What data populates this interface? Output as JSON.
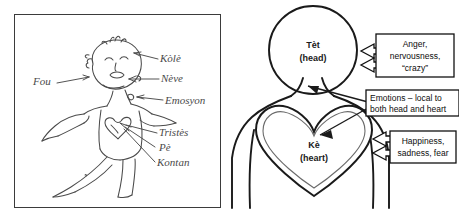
{
  "figure": {
    "panels": [
      "sketch-panel",
      "diagram-panel"
    ]
  },
  "left_panel": {
    "name": "hand-drawn-sketch",
    "description": "Hand drawn sketch of a person with arms outstretched, a heart on the chest, and handwritten Haitian Creole labels with arrows",
    "labels": [
      {
        "text": "Fou",
        "target": "head",
        "position": "left"
      },
      {
        "text": "Kòlè",
        "target": "head",
        "position": "upper-right"
      },
      {
        "text": "Nève",
        "target": "head",
        "position": "right"
      },
      {
        "text": "Emosyon",
        "target": "neck",
        "position": "right"
      },
      {
        "text": "Tristès",
        "target": "heart",
        "position": "lower-right"
      },
      {
        "text": "Pè",
        "target": "heart",
        "position": "lower-right"
      },
      {
        "text": "Kontan",
        "target": "heart",
        "position": "lower-right"
      }
    ]
  },
  "right_panel": {
    "name": "labeled-diagram",
    "head": {
      "label_primary": "Tèt",
      "label_secondary": "(head)"
    },
    "heart": {
      "label_primary": "Kè",
      "label_secondary": "(heart)"
    },
    "callouts": [
      {
        "id": "head-emotions",
        "lines": [
          "Anger,",
          "nervousness,",
          "“crazy”"
        ],
        "points_to": "head",
        "arrow_style": "double-block-arrow"
      },
      {
        "id": "shared-emotions",
        "lines": [
          "Emotions – local to",
          "both head and heart"
        ],
        "points_to": "head and heart",
        "arrow_style": "forked-thin-arrow"
      },
      {
        "id": "heart-emotions",
        "lines": [
          "Happiness,",
          "sadness, fear"
        ],
        "points_to": "heart",
        "arrow_style": "double-block-arrow"
      }
    ]
  },
  "colors": {
    "ink": "#1a1a1a",
    "sketch_ink": "#4a4a4a",
    "panel_border": "#3b3b3b",
    "background": "#ffffff"
  }
}
